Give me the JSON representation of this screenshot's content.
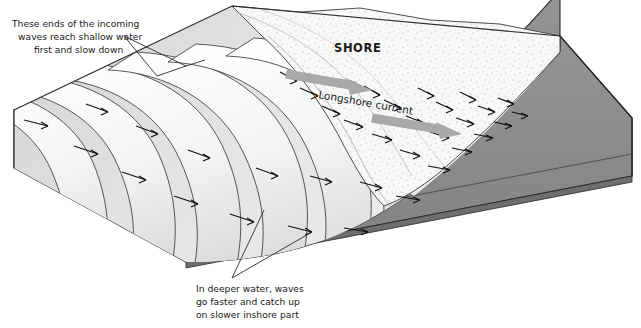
{
  "figure": {
    "width": 641,
    "height": 328
  },
  "labels": {
    "shore": "SHORE",
    "longshore_current": "Longshore current"
  },
  "annotations": {
    "top_left": {
      "line1": "These ends of the incoming",
      "line2": "waves reach shallow water",
      "line3": "first and slow down"
    },
    "bottom_center": {
      "line1": "In deeper water, waves",
      "line2": "go faster and catch up",
      "line3": "on slower inshore part"
    }
  },
  "colors": {
    "block_side_gray": "#8d8d8d",
    "block_front_gray": "#919191",
    "block_dark_edge": "#6f6f6f",
    "water_light": "#efefef",
    "wave_crest": "#fbfbfb",
    "wave_trough": "#d9d9d9",
    "sand_light": "#f7f7f7",
    "sand_speckle": "#9a9a9a",
    "outline": "#2a2a2a",
    "current_arrow": "#a9a9a9",
    "text": "#1a1a1a"
  },
  "elements": {
    "wave_crest_count": 12,
    "wave_arrow_count": 34,
    "current_arrow_count": 2,
    "leader_line_count": 4
  }
}
